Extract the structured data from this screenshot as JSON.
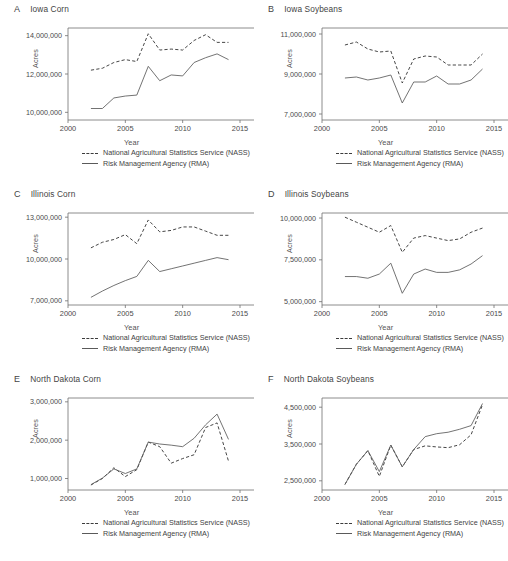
{
  "figure": {
    "legend": {
      "nass_label": "National Agricultural Statistics Service (NASS)",
      "nass_style": "dashed",
      "rma_label": "Risk Management Agency (RMA)",
      "rma_style": "solid"
    },
    "axis": {
      "xlabel": "Year",
      "ylabel": "Acres"
    },
    "colors": {
      "nass": "#3c3c3c",
      "rma": "#5a5a5a",
      "axis": "#6e6e6e",
      "text": "#444444"
    }
  },
  "chart_data": [
    {
      "panel": "A",
      "type": "line",
      "title": "Iowa Corn",
      "xlabel": "Year",
      "ylabel": "Acres",
      "xlim": [
        2000,
        2015
      ],
      "ylim": [
        9600000,
        14400000
      ],
      "xticks": [
        2000,
        2005,
        2010,
        2015
      ],
      "yticks": [
        10000000,
        12000000,
        14000000
      ],
      "ytick_labels": [
        "10,000,000",
        "12,000,000",
        "14,000,000"
      ],
      "grid": false,
      "legend_position": "below",
      "x": [
        2002,
        2003,
        2004,
        2005,
        2006,
        2007,
        2008,
        2009,
        2010,
        2011,
        2012,
        2013,
        2014
      ],
      "series": [
        {
          "name": "National Agricultural Statistics Service (NASS)",
          "values": [
            12200000,
            12300000,
            12600000,
            12750000,
            12650000,
            14100000,
            13250000,
            13300000,
            13250000,
            13750000,
            14050000,
            13650000,
            13650000
          ]
        },
        {
          "name": "Risk Management Agency (RMA)",
          "values": [
            10200000,
            10200000,
            10750000,
            10850000,
            10900000,
            12400000,
            11650000,
            11950000,
            11900000,
            12600000,
            12850000,
            13050000,
            12750000
          ]
        }
      ]
    },
    {
      "panel": "B",
      "type": "line",
      "title": "Iowa Soybeans",
      "xlabel": "Year",
      "ylabel": "Acres",
      "xlim": [
        2000,
        2015
      ],
      "ylim": [
        6700000,
        11300000
      ],
      "xticks": [
        2000,
        2005,
        2010,
        2015
      ],
      "yticks": [
        7000000,
        9000000,
        11000000
      ],
      "ytick_labels": [
        "7,000,000",
        "9,000,000",
        "11,000,000"
      ],
      "grid": false,
      "legend_position": "below",
      "x": [
        2002,
        2003,
        2004,
        2005,
        2006,
        2007,
        2008,
        2009,
        2010,
        2011,
        2012,
        2013,
        2014
      ],
      "series": [
        {
          "name": "National Agricultural Statistics Service (NASS)",
          "values": [
            10450000,
            10600000,
            10250000,
            10100000,
            10150000,
            8550000,
            9750000,
            9900000,
            9850000,
            9450000,
            9450000,
            9450000,
            10000000
          ]
        },
        {
          "name": "Risk Management Agency (RMA)",
          "values": [
            8800000,
            8850000,
            8700000,
            8800000,
            8950000,
            7550000,
            8600000,
            8600000,
            8900000,
            8500000,
            8500000,
            8700000,
            9250000
          ]
        }
      ]
    },
    {
      "panel": "C",
      "type": "line",
      "title": "Illinois Corn",
      "xlabel": "Year",
      "ylabel": "Acres",
      "xlim": [
        2000,
        2015
      ],
      "ylim": [
        6700000,
        13300000
      ],
      "xticks": [
        2000,
        2005,
        2010,
        2015
      ],
      "yticks": [
        7000000,
        10000000,
        13000000
      ],
      "ytick_labels": [
        "7,000,000",
        "10,000,000",
        "13,000,000"
      ],
      "grid": false,
      "legend_position": "below",
      "x": [
        2002,
        2003,
        2004,
        2005,
        2006,
        2007,
        2008,
        2009,
        2010,
        2011,
        2012,
        2013,
        2014
      ],
      "series": [
        {
          "name": "National Agricultural Statistics Service (NASS)",
          "values": [
            10800000,
            11200000,
            11400000,
            11750000,
            11100000,
            12800000,
            11950000,
            12050000,
            12300000,
            12300000,
            12000000,
            11700000,
            11700000
          ]
        },
        {
          "name": "Risk Management Agency (RMA)",
          "values": [
            7250000,
            7700000,
            8100000,
            8450000,
            8750000,
            9900000,
            9100000,
            9300000,
            9500000,
            9700000,
            9900000,
            10100000,
            9950000
          ]
        }
      ]
    },
    {
      "panel": "D",
      "type": "line",
      "title": "Illinois Soybeans",
      "xlabel": "Year",
      "ylabel": "Acres",
      "xlim": [
        2000,
        2015
      ],
      "ylim": [
        4800000,
        10300000
      ],
      "xticks": [
        2000,
        2005,
        2010,
        2015
      ],
      "yticks": [
        5000000,
        7500000,
        10000000
      ],
      "ytick_labels": [
        "5,000,000",
        "7,500,000",
        "10,000,000"
      ],
      "grid": false,
      "legend_position": "below",
      "x": [
        2002,
        2003,
        2004,
        2005,
        2006,
        2007,
        2008,
        2009,
        2010,
        2011,
        2012,
        2013,
        2014
      ],
      "series": [
        {
          "name": "National Agricultural Statistics Service (NASS)",
          "values": [
            10050000,
            9750000,
            9450000,
            9150000,
            9550000,
            7950000,
            8800000,
            8950000,
            8800000,
            8650000,
            8750000,
            9150000,
            9400000
          ]
        },
        {
          "name": "Risk Management Agency (RMA)",
          "values": [
            6500000,
            6500000,
            6400000,
            6650000,
            7300000,
            5500000,
            6650000,
            6950000,
            6750000,
            6750000,
            6900000,
            7250000,
            7750000
          ]
        }
      ]
    },
    {
      "panel": "E",
      "type": "line",
      "title": "North Dakota Corn",
      "xlabel": "Year",
      "ylabel": "Acres",
      "xlim": [
        2000,
        2015
      ],
      "ylim": [
        700000,
        3100000
      ],
      "xticks": [
        2000,
        2005,
        2010,
        2015
      ],
      "yticks": [
        1000000,
        2000000,
        3000000
      ],
      "ytick_labels": [
        "1,000,000",
        "2,000,000",
        "3,000,000"
      ],
      "grid": false,
      "legend_position": "below",
      "x": [
        2002,
        2003,
        2004,
        2005,
        2006,
        2007,
        2008,
        2009,
        2010,
        2011,
        2012,
        2013,
        2014
      ],
      "series": [
        {
          "name": "National Agricultural Statistics Service (NASS)",
          "values": [
            830000,
            1000000,
            1280000,
            1050000,
            1230000,
            1950000,
            1830000,
            1400000,
            1520000,
            1620000,
            2330000,
            2450000,
            1450000
          ]
        },
        {
          "name": "Risk Management Agency (RMA)",
          "values": [
            840000,
            1010000,
            1250000,
            1130000,
            1250000,
            1950000,
            1900000,
            1870000,
            1830000,
            2050000,
            2400000,
            2680000,
            2020000
          ]
        }
      ]
    },
    {
      "panel": "F",
      "type": "line",
      "title": "North Dakota Soybeans",
      "xlabel": "Year",
      "ylabel": "Acres",
      "xlim": [
        2000,
        2015
      ],
      "ylim": [
        2250000,
        4750000
      ],
      "xticks": [
        2000,
        2005,
        2010,
        2015
      ],
      "yticks": [
        2500000,
        3500000,
        4500000
      ],
      "ytick_labels": [
        "2,500,000",
        "3,500,000",
        "4,500,000"
      ],
      "grid": false,
      "legend_position": "below",
      "x": [
        2002,
        2003,
        2004,
        2005,
        2006,
        2007,
        2008,
        2009,
        2010,
        2011,
        2012,
        2013,
        2014
      ],
      "series": [
        {
          "name": "National Agricultural Statistics Service (NASS)",
          "values": [
            2400000,
            2950000,
            3320000,
            2620000,
            3470000,
            2880000,
            3350000,
            3450000,
            3420000,
            3400000,
            3480000,
            3750000,
            4570000
          ]
        },
        {
          "name": "Risk Management Agency (RMA)",
          "values": [
            2400000,
            2950000,
            3320000,
            2750000,
            3470000,
            2880000,
            3350000,
            3700000,
            3780000,
            3820000,
            3900000,
            4000000,
            4600000
          ]
        }
      ]
    }
  ]
}
